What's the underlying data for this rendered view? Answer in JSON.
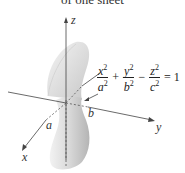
{
  "title": "of one sheet",
  "axes": {
    "x": "x",
    "y": "y",
    "z": "z"
  },
  "semi_axes": {
    "a": "a",
    "b": "b",
    "a_pointer": "a"
  },
  "equation": {
    "terms": [
      {
        "num": "x",
        "den": "a",
        "exp": "2"
      },
      {
        "num": "y",
        "den": "b",
        "exp": "2"
      },
      {
        "num": "z",
        "den": "c",
        "exp": "2"
      }
    ],
    "ops": [
      "+",
      "−"
    ],
    "rhs": "= 1"
  },
  "colors": {
    "surface_light": "#ececec",
    "surface_dark": "#b8b8b8",
    "axis": "#444444"
  }
}
